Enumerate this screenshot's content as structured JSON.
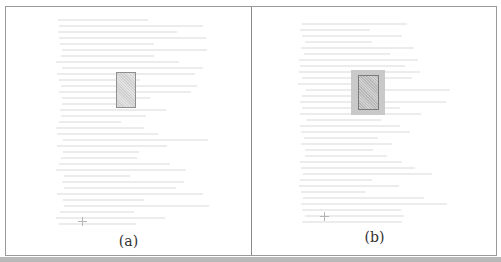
{
  "figure": {
    "panels": [
      {
        "id": "a",
        "caption": "(a)",
        "description": "Document page with single highlighted rectangle region"
      },
      {
        "id": "b",
        "caption": "(b)",
        "description": "Document page with highlighted rectangle surrounded by enlarged gray margin region"
      }
    ],
    "colors": {
      "border": "#9a9a9a",
      "highlight_fill": "#d8d8d8",
      "margin_fill": "#c9c9c9",
      "text_faint": "#ececec"
    }
  }
}
